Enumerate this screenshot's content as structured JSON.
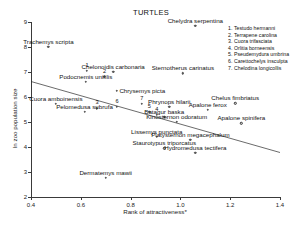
{
  "chart": {
    "title": "TURTLES",
    "xlabel": "Rank of attractiveness*",
    "ylabel": "ln zoo population size"
  },
  "axis": {
    "yticks": [
      "2",
      "3",
      "4",
      "5",
      "6",
      "7",
      "8",
      "9"
    ],
    "xticks": [
      "0.4",
      "0.6",
      "0.8",
      "1.0",
      "1.2",
      "1.4"
    ]
  },
  "legend": {
    "items": [
      {
        "num": "1.",
        "name": "Testudo hermanni"
      },
      {
        "num": "2.",
        "name": "Terrapene carolina"
      },
      {
        "num": "3.",
        "name": "Cuora trifasciata"
      },
      {
        "num": "4.",
        "name": "Orlitia borneensis"
      },
      {
        "num": "5.",
        "name": "Pseudemydura umbrina"
      },
      {
        "num": "6.",
        "name": "Carettochelys insculpta"
      },
      {
        "num": "7.",
        "name": "Chelodina longicollis"
      }
    ]
  },
  "chart_data": {
    "type": "scatter",
    "title": "TURTLES",
    "xlabel": "Rank of attractiveness*",
    "ylabel": "ln zoo population size",
    "xlim": [
      0.4,
      1.4
    ],
    "ylim": [
      2,
      9
    ],
    "grid": false,
    "legend_position": "top-right",
    "annotation": "* asterisk on x-axis label denotes footnote",
    "trendline": {
      "x": [
        0.4,
        1.4
      ],
      "y": [
        6.62,
        3.78
      ]
    },
    "points": [
      {
        "label": "Chelydra serpentina",
        "x": 1.06,
        "y": 8.85,
        "label_pos": "above"
      },
      {
        "label": "Trachemys scripta",
        "x": 0.47,
        "y": 8.0,
        "label_pos": "above"
      },
      {
        "label": "Chelonoidis carbonaria",
        "x": 0.73,
        "y": 7.0,
        "label_pos": "above"
      },
      {
        "label": "Sternotherus carinatus",
        "x": 1.01,
        "y": 6.95,
        "label_pos": "above"
      },
      {
        "label": "Podocnemis unifilis",
        "x": 0.62,
        "y": 6.6,
        "label_pos": "above"
      },
      {
        "label": "Chrysemys picta",
        "x": 0.745,
        "y": 6.25,
        "label_pos": "right"
      },
      {
        "label": "Cuora amboinensis",
        "x": 0.5,
        "y": 5.72,
        "label_pos": "above"
      },
      {
        "label": "Chelus fimbriatus",
        "x": 1.22,
        "y": 5.75,
        "label_pos": "above"
      },
      {
        "label": "Apalone ferox",
        "x": 1.11,
        "y": 5.5,
        "label_pos": "above"
      },
      {
        "label": "Phrynops hilarii",
        "x": 0.955,
        "y": 5.6,
        "label_pos": "above"
      },
      {
        "label": "Pelomedusa subrufa",
        "x": 0.615,
        "y": 5.4,
        "label_pos": "above"
      },
      {
        "label": "Batagur baska",
        "x": 0.935,
        "y": 5.2,
        "label_pos": "above"
      },
      {
        "label": "Kinosternon odoratum",
        "x": 0.985,
        "y": 5.0,
        "label_pos": "above"
      },
      {
        "label": "Apalone spinifera",
        "x": 1.245,
        "y": 4.95,
        "label_pos": "above"
      },
      {
        "label": "Lissemys punctata",
        "x": 0.905,
        "y": 4.4,
        "label_pos": "above"
      },
      {
        "label": "Platysternon megacephalum",
        "x": 1.04,
        "y": 4.3,
        "label_pos": "above"
      },
      {
        "label": "Staurotypus triporcatus",
        "x": 0.935,
        "y": 3.95,
        "label_pos": "above"
      },
      {
        "label": "Hydromedusa tectifera",
        "x": 1.06,
        "y": 3.78,
        "label_pos": "above"
      },
      {
        "label": "Dermatemys mawii",
        "x": 0.7,
        "y": 2.78,
        "label_pos": "above"
      },
      {
        "label": "Testudo hermanni",
        "x": 0.625,
        "y": 7.05,
        "marker_num": "1"
      },
      {
        "label": "Terrapene carolina",
        "x": 0.695,
        "y": 6.82,
        "marker_num": "2"
      },
      {
        "label": "Cuora trifasciata",
        "x": 0.665,
        "y": 5.55,
        "marker_num": "3"
      },
      {
        "label": "Orlitia borneensis",
        "x": 0.905,
        "y": 5.3,
        "marker_num": "4"
      },
      {
        "label": "Pseudemydura umbrina",
        "x": 0.875,
        "y": 5.4,
        "marker_num": "5"
      },
      {
        "label": "Carettochelys insculpta",
        "x": 0.745,
        "y": 5.6,
        "marker_num": "6"
      },
      {
        "label": "Chelodina longicollis",
        "x": 0.845,
        "y": 5.72,
        "marker_num": "7"
      }
    ]
  }
}
